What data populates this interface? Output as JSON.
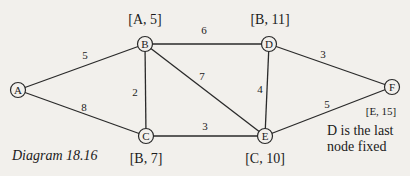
{
  "caption": "Diagram 18.16",
  "note": {
    "line1": "D is the last",
    "line2": "node fixed"
  },
  "nodes": [
    {
      "id": "A",
      "x": 18,
      "y": 90,
      "label": null
    },
    {
      "id": "B",
      "x": 145,
      "y": 44,
      "label": "[A, 5]"
    },
    {
      "id": "C",
      "x": 146,
      "y": 136,
      "label": "[B, 7]"
    },
    {
      "id": "D",
      "x": 269,
      "y": 44,
      "label": "[B, 11]"
    },
    {
      "id": "E",
      "x": 265,
      "y": 136,
      "label": "[C, 10]"
    },
    {
      "id": "F",
      "x": 392,
      "y": 87,
      "label": "[E, 15]"
    }
  ],
  "edges": [
    {
      "from": "A",
      "to": "B",
      "weight": "5"
    },
    {
      "from": "A",
      "to": "C",
      "weight": "8"
    },
    {
      "from": "B",
      "to": "C",
      "weight": "2"
    },
    {
      "from": "B",
      "to": "D",
      "weight": "6"
    },
    {
      "from": "B",
      "to": "E",
      "weight": "7"
    },
    {
      "from": "C",
      "to": "E",
      "weight": "3"
    },
    {
      "from": "D",
      "to": "E",
      "weight": "4"
    },
    {
      "from": "D",
      "to": "F",
      "weight": "3"
    },
    {
      "from": "E",
      "to": "F",
      "weight": "5"
    }
  ],
  "labels": {
    "B": "[A, 5]",
    "D": "[B, 11]",
    "C": "[B, 7]",
    "E": "[C, 10]",
    "F": "[E, 15]"
  },
  "weights": {
    "AB": "5",
    "AC": "8",
    "BC": "2",
    "BD": "6",
    "BE": "7",
    "CE": "3",
    "DE": "4",
    "DF": "3",
    "EF": "5"
  },
  "node_names": {
    "A": "A",
    "B": "B",
    "C": "C",
    "D": "D",
    "E": "E",
    "F": "F"
  }
}
